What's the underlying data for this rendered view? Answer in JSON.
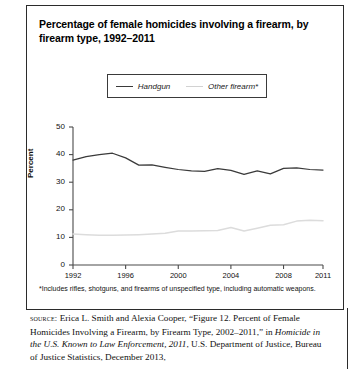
{
  "figure": {
    "title": "Percentage of female homicides involving a firearm, by firearm type, 1992–2011",
    "footnote": "*Includes rifles, shotguns, and firearms of unspecified type, including automatic weapons.",
    "source_label": "source:",
    "source_line1": " Erica L. Smith and Alexia Cooper, “Figure 12. Percent of Female Homicides Involving a Firearm, by Firearm Type, 2002–2011,” in ",
    "source_italic": "Homicide in the U.S. Known to Law Enforcement, 2011",
    "source_line2": ", U.S. Department of Justice, Bureau of Justice Statistics, December 2013,"
  },
  "colors": {
    "handgun": "#3a3a3a",
    "other_firearm": "#dcdcdc",
    "axis": "#4a4a4a",
    "border": "#2b2b2b"
  },
  "chart_data": {
    "type": "line",
    "title": "Percentage of female homicides involving a firearm, by firearm type, 1992–2011",
    "xlabel": "",
    "ylabel": "Percent",
    "ylim": [
      0,
      50
    ],
    "yticks": [
      0,
      10,
      20,
      30,
      40,
      50
    ],
    "xlim": [
      1992,
      2011
    ],
    "xticks": [
      1992,
      1996,
      2000,
      2004,
      2008,
      2011
    ],
    "x": [
      1992,
      1993,
      1994,
      1995,
      1996,
      1997,
      1998,
      1999,
      2000,
      2001,
      2002,
      2003,
      2004,
      2005,
      2006,
      2007,
      2008,
      2009,
      2010,
      2011
    ],
    "grid": false,
    "legend_position": "top-center",
    "series": [
      {
        "name": "Handgun",
        "color": "#3a3a3a",
        "values": [
          38.0,
          39.3,
          40.0,
          40.5,
          38.8,
          36.2,
          36.3,
          35.4,
          34.6,
          34.1,
          33.9,
          34.9,
          34.3,
          32.8,
          34.1,
          33.0,
          35.0,
          35.2,
          34.6,
          34.4
        ]
      },
      {
        "name": "Other firearm*",
        "color": "#dcdcdc",
        "values": [
          11.2,
          11.0,
          10.8,
          10.8,
          10.9,
          11.0,
          11.2,
          11.5,
          12.3,
          12.3,
          12.4,
          12.5,
          13.6,
          12.3,
          13.3,
          14.4,
          14.6,
          15.9,
          16.2,
          16.0
        ]
      }
    ]
  }
}
